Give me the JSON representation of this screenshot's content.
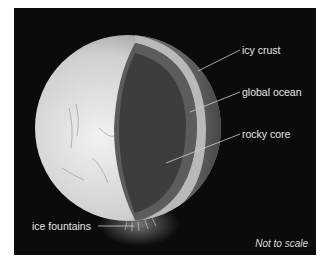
{
  "diagram": {
    "labels": {
      "icy_crust": "icy crust",
      "global_ocean": "global ocean",
      "rocky_core": "rocky core",
      "ice_fountains": "ice fountains"
    },
    "note": "Not to scale",
    "colors": {
      "background": "#0b0b0b",
      "surface": "#d8d8d8",
      "crust": "#bdbdbd",
      "ocean": "#5a5a5a",
      "core": "#3c3c3c",
      "label_text": "#e6e6e6",
      "leader_line": "#cfcfcf"
    }
  }
}
